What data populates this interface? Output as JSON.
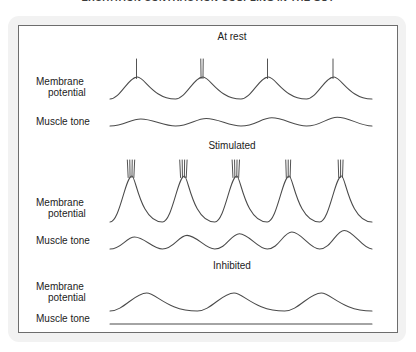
{
  "figure": {
    "title": "EXCITATION CONTRACTION COUPLING IN THE GUT"
  },
  "labels": {
    "membrane_potential": "Membrane\npotential",
    "membrane_potential_line1": "Membrane",
    "membrane_potential_line2": "potential",
    "muscle_tone": "Muscle tone"
  },
  "sections": [
    {
      "id": "at-rest",
      "heading": "At rest",
      "membrane_potential_label_line1": "Membrane",
      "membrane_potential_label_line2": "potential",
      "muscle_tone_label": "Muscle tone"
    },
    {
      "id": "stimulated",
      "heading": "Stimulated",
      "membrane_potential_label_line1": "Membrane",
      "membrane_potential_label_line2": "potential",
      "muscle_tone_label": "Muscle tone"
    },
    {
      "id": "inhibited",
      "heading": "Inhibited",
      "membrane_potential_label_line1": "Membrane",
      "membrane_potential_label_line2": "potential",
      "muscle_tone_label": "Muscle tone"
    }
  ],
  "colors": {
    "trace": "#4a4a4a",
    "panel_border": "#6d6d6d",
    "outer_frame": "#f2f2f2",
    "panel_background": "#ffffff",
    "text": "#1c1c1c"
  },
  "chart_data": {
    "type": "line",
    "title": "EXCITATION CONTRACTION COUPLING IN THE GUT",
    "xlabel": "",
    "ylabel": "",
    "grid": false,
    "legend": "none",
    "panels": [
      {
        "name": "At rest",
        "traces": [
          {
            "name": "Membrane potential",
            "waveform": "slow-wave",
            "cycles": 4,
            "slow_wave_amplitude_rel": 0.42,
            "spikes_per_crest": [
              1,
              2,
              1,
              1
            ],
            "spike_height_rel": 0.55,
            "description": "Low-amplitude slow waves, each crest topped by one or two action-potential spikes"
          },
          {
            "name": "Muscle tone",
            "waveform": "low-amplitude-undulation",
            "cycles": 4,
            "amplitude_rel": 0.16,
            "description": "Gentle small-amplitude contraction waves"
          }
        ]
      },
      {
        "name": "Stimulated",
        "traces": [
          {
            "name": "Membrane potential",
            "waveform": "slow-wave",
            "cycles": 5,
            "slow_wave_amplitude_rel": 1.0,
            "spikes_per_crest": [
              4,
              4,
              4,
              3,
              3
            ],
            "spike_height_rel": 0.75,
            "description": "Depolarised, high-amplitude slow waves with bursts of three to four spikes on every crest"
          },
          {
            "name": "Muscle tone",
            "waveform": "large-undulation",
            "cycles": 5,
            "amplitude_rel": 0.55,
            "description": "Strong rhythmic contractions of increasing amplitude"
          }
        ]
      },
      {
        "name": "Inhibited",
        "traces": [
          {
            "name": "Membrane potential",
            "waveform": "slow-wave",
            "cycles": 3,
            "slow_wave_amplitude_rel": 0.4,
            "spikes_per_crest": [
              0,
              0,
              0
            ],
            "spike_height_rel": 0,
            "description": "Hyperpolarised rounded slow waves that never reach threshold, so no spikes occur"
          },
          {
            "name": "Muscle tone",
            "waveform": "flat",
            "cycles": 0,
            "amplitude_rel": 0,
            "description": "Flat line - no contractile activity"
          }
        ]
      }
    ]
  }
}
